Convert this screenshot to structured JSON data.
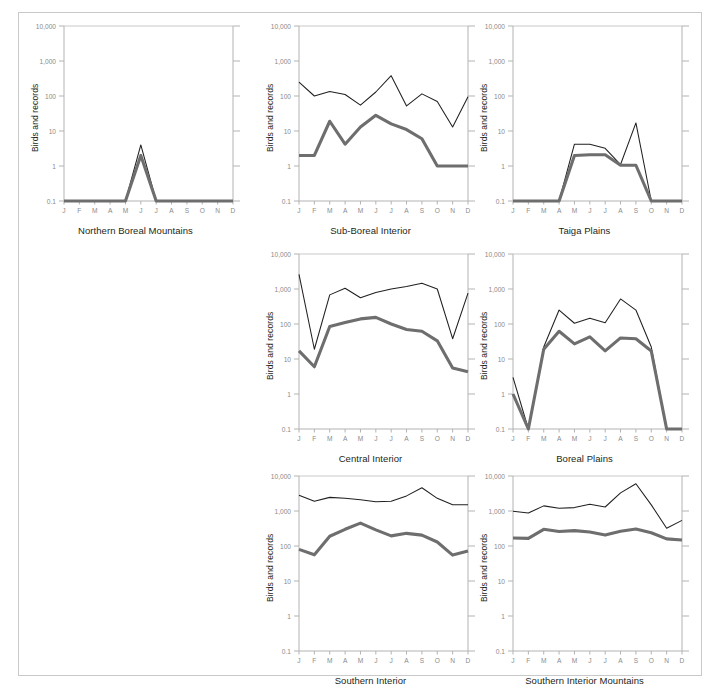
{
  "figure": {
    "axis_label": "Birds and records",
    "x_tick_labels": [
      "J",
      "F",
      "M",
      "A",
      "M",
      "J",
      "J",
      "A",
      "S",
      "O",
      "N",
      "D"
    ],
    "y_tick_labels": [
      "10,000",
      "1,000",
      "100",
      "10",
      "1",
      "0.1"
    ],
    "y_tick_values": [
      10000,
      1000,
      100,
      10,
      1,
      0.1
    ],
    "colors": {
      "records_line": "#231f20",
      "birds_line": "#6e6e6e",
      "axis": "#b3b3b3",
      "gridline": "#c9c9c9",
      "tick_text": "#8a8a8a",
      "title_text": "#231f20",
      "frame": "#c9c9c9",
      "background": "#ffffff"
    }
  },
  "chart_data": [
    {
      "type": "line",
      "title": "Northern Boreal Mountains",
      "xlabel": "",
      "ylabel": "Birds and records",
      "scale": "log",
      "ylim": [
        0.1,
        10000
      ],
      "grid": true,
      "legend": "none",
      "categories": [
        "J",
        "F",
        "M",
        "A",
        "M",
        "J",
        "J",
        "A",
        "S",
        "O",
        "N",
        "D"
      ],
      "series": [
        {
          "name": "records",
          "style": "thin-black",
          "values": [
            0.1,
            0.1,
            0.1,
            0.1,
            0.1,
            4.0,
            0.1,
            0.1,
            0.1,
            0.1,
            0.1,
            0.1
          ]
        },
        {
          "name": "birds",
          "style": "thick-gray",
          "values": [
            0.1,
            0.1,
            0.1,
            0.1,
            0.1,
            2.0,
            0.1,
            0.1,
            0.1,
            0.1,
            0.1,
            0.1
          ]
        }
      ]
    },
    {
      "type": "line",
      "title": "Sub-Boreal Interior",
      "xlabel": "",
      "ylabel": "Birds and records",
      "scale": "log",
      "ylim": [
        0.1,
        10000
      ],
      "grid": true,
      "legend": "none",
      "categories": [
        "J",
        "F",
        "M",
        "A",
        "M",
        "J",
        "J",
        "A",
        "S",
        "O",
        "N",
        "D"
      ],
      "series": [
        {
          "name": "records",
          "style": "thin-black",
          "values": [
            250,
            100,
            135,
            110,
            55,
            130,
            380,
            52,
            115,
            70,
            13,
            95
          ]
        },
        {
          "name": "birds",
          "style": "thick-gray",
          "values": [
            2.0,
            2.0,
            19,
            4.2,
            13,
            28,
            16,
            11,
            6.0,
            1.0,
            1.0,
            1.0
          ]
        }
      ]
    },
    {
      "type": "line",
      "title": "Taiga Plains",
      "xlabel": "",
      "ylabel": "Birds and records",
      "scale": "log",
      "ylim": [
        0.1,
        10000
      ],
      "grid": true,
      "legend": "none",
      "categories": [
        "J",
        "F",
        "M",
        "A",
        "M",
        "J",
        "J",
        "A",
        "S",
        "O",
        "N",
        "D"
      ],
      "series": [
        {
          "name": "records",
          "style": "thin-black",
          "values": [
            0.1,
            0.1,
            0.1,
            0.1,
            4.2,
            4.2,
            3.2,
            1.1,
            17,
            0.1,
            0.1,
            0.1
          ]
        },
        {
          "name": "birds",
          "style": "thick-gray",
          "values": [
            0.1,
            0.1,
            0.1,
            0.1,
            2.0,
            2.1,
            2.1,
            1.05,
            1.05,
            0.1,
            0.1,
            0.1
          ]
        }
      ]
    },
    {
      "type": "line",
      "title": "Central Interior",
      "xlabel": "",
      "ylabel": "Birds and records",
      "scale": "log",
      "ylim": [
        0.1,
        10000
      ],
      "grid": true,
      "legend": "none",
      "categories": [
        "J",
        "F",
        "M",
        "A",
        "M",
        "J",
        "J",
        "A",
        "S",
        "O",
        "N",
        "D"
      ],
      "series": [
        {
          "name": "records",
          "style": "thin-black",
          "values": [
            2600,
            19,
            680,
            1050,
            560,
            800,
            1000,
            1180,
            1450,
            1000,
            38,
            760
          ]
        },
        {
          "name": "birds",
          "style": "thick-gray",
          "values": [
            17,
            6.0,
            85,
            110,
            140,
            155,
            100,
            70,
            62,
            33,
            5.5,
            4.3
          ]
        }
      ]
    },
    {
      "type": "line",
      "title": "Boreal Plains",
      "xlabel": "",
      "ylabel": "Birds and records",
      "scale": "log",
      "ylim": [
        0.1,
        10000
      ],
      "grid": true,
      "legend": "none",
      "categories": [
        "J",
        "F",
        "M",
        "A",
        "M",
        "J",
        "J",
        "A",
        "S",
        "O",
        "N",
        "D"
      ],
      "series": [
        {
          "name": "records",
          "style": "thin-black",
          "values": [
            3.0,
            0.1,
            22,
            250,
            105,
            145,
            108,
            520,
            250,
            22,
            0.1,
            0.1
          ]
        },
        {
          "name": "birds",
          "style": "thick-gray",
          "values": [
            1.0,
            0.1,
            19,
            62,
            27,
            43,
            17,
            40,
            38,
            17,
            0.1,
            0.1
          ]
        }
      ]
    },
    {
      "type": "line",
      "title": "Southern Interior",
      "xlabel": "",
      "ylabel": "Birds and records",
      "scale": "log",
      "ylim": [
        0.1,
        10000
      ],
      "grid": true,
      "legend": "none",
      "categories": [
        "J",
        "F",
        "M",
        "A",
        "M",
        "J",
        "J",
        "A",
        "S",
        "O",
        "N",
        "D"
      ],
      "series": [
        {
          "name": "records",
          "style": "thin-black",
          "values": [
            2800,
            1900,
            2450,
            2300,
            2100,
            1850,
            1900,
            2700,
            4600,
            2300,
            1500,
            1500
          ]
        },
        {
          "name": "birds",
          "style": "thick-gray",
          "values": [
            80,
            56,
            190,
            300,
            450,
            290,
            195,
            230,
            205,
            130,
            55,
            72
          ]
        }
      ]
    },
    {
      "type": "line",
      "title": "Southern Interior Mountains",
      "xlabel": "",
      "ylabel": "Birds and records",
      "scale": "log",
      "ylim": [
        0.1,
        10000
      ],
      "grid": true,
      "legend": "none",
      "categories": [
        "J",
        "F",
        "M",
        "A",
        "M",
        "J",
        "J",
        "A",
        "S",
        "O",
        "N",
        "D"
      ],
      "series": [
        {
          "name": "records",
          "style": "thin-black",
          "values": [
            980,
            880,
            1400,
            1200,
            1250,
            1550,
            1300,
            3300,
            6000,
            1500,
            320,
            540
          ]
        },
        {
          "name": "birds",
          "style": "thick-gray",
          "values": [
            170,
            165,
            300,
            260,
            275,
            250,
            205,
            265,
            305,
            240,
            160,
            148
          ]
        }
      ]
    }
  ]
}
